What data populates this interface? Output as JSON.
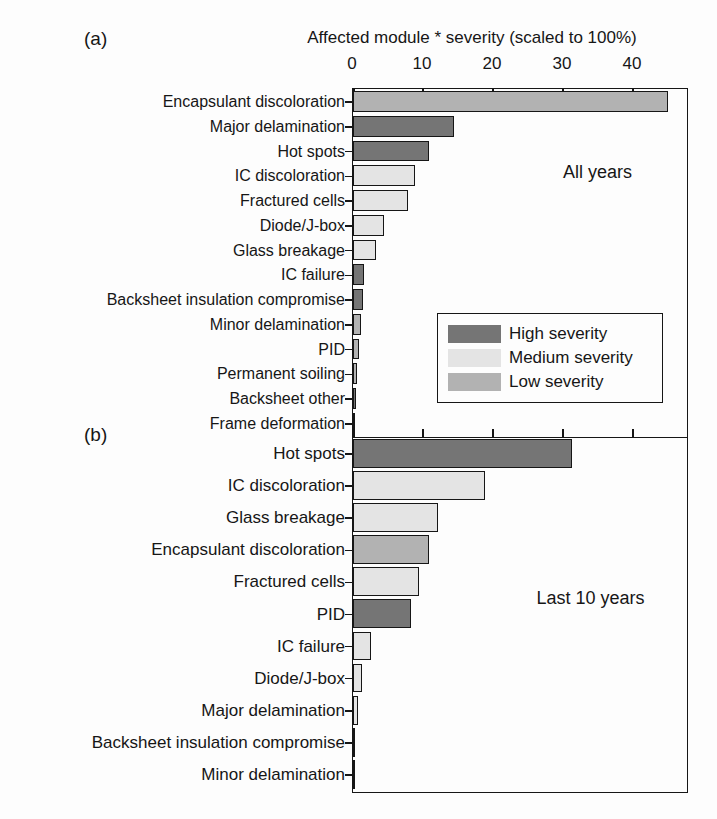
{
  "title": "Affected module * severity (scaled to 100%)",
  "colors": {
    "high": "#757575",
    "medium": "#e4e4e4",
    "low": "#b2b2b2",
    "axis": "#161616"
  },
  "legend": {
    "items": [
      {
        "label": "High severity",
        "color_key": "high"
      },
      {
        "label": "Medium severity",
        "color_key": "medium"
      },
      {
        "label": "Low severity",
        "color_key": "low"
      }
    ]
  },
  "chart_data": [
    {
      "type": "bar",
      "orientation": "horizontal",
      "panel": "(a)",
      "annotation": "All years",
      "xlabel": "Affected module * severity (scaled to 100%)",
      "xlim": [
        0,
        48
      ],
      "xticks": [
        0,
        10,
        20,
        30,
        40
      ],
      "grid": false,
      "categories": [
        "Encapsulant discoloration",
        "Major delamination",
        "Hot spots",
        "IC discoloration",
        "Fractured cells",
        "Diode/J-box",
        "Glass breakage",
        "IC failure",
        "Backsheet insulation compromise",
        "Minor delamination",
        "PID",
        "Permanent soiling",
        "Backsheet other",
        "Frame deformation"
      ],
      "values": [
        45,
        14.4,
        10.8,
        8.8,
        7.8,
        4.4,
        3.3,
        1.6,
        1.4,
        1.1,
        0.9,
        0.6,
        0.4,
        0.3
      ],
      "severity": [
        "low",
        "high",
        "high",
        "medium",
        "medium",
        "medium",
        "medium",
        "high",
        "high",
        "low",
        "low",
        "low",
        "high",
        "high"
      ]
    },
    {
      "type": "bar",
      "orientation": "horizontal",
      "panel": "(b)",
      "annotation": "Last 10 years",
      "xlabel": "Affected module * severity (scaled to 100%)",
      "xlim": [
        0,
        48
      ],
      "xticks": [
        0,
        10,
        20,
        30,
        40
      ],
      "grid": false,
      "categories": [
        "Hot spots",
        "IC discoloration",
        "Glass breakage",
        "Encapsulant discoloration",
        "Fractured cells",
        "PID",
        "IC failure",
        "Diode/J-box",
        "Major delamination",
        "Backsheet insulation compromise",
        "Minor delamination"
      ],
      "values": [
        31.3,
        18.8,
        12.1,
        10.8,
        9.4,
        8.3,
        2.6,
        1.3,
        0.7,
        0.2,
        0.1
      ],
      "severity": [
        "high",
        "medium",
        "medium",
        "low",
        "medium",
        "high",
        "medium",
        "medium",
        "medium",
        "high",
        "low"
      ]
    }
  ]
}
